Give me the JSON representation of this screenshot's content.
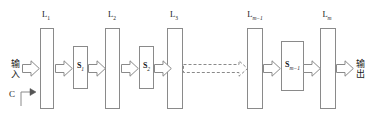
{
  "diagram": {
    "type": "block-diagram",
    "background_color": "#ffffff",
    "stroke_color": "#8a8a8a",
    "text_color": "#1a1a1a",
    "input_label": {
      "line1": "输",
      "line2": "入"
    },
    "output_label": {
      "line1": "输",
      "line2": "出"
    },
    "control_label": "C",
    "layers": [
      {
        "name": "L1",
        "base": "L",
        "sub": "1",
        "sub_italic": false
      },
      {
        "name": "L2",
        "base": "L",
        "sub": "2",
        "sub_italic": false
      },
      {
        "name": "L3",
        "base": "L",
        "sub": "3",
        "sub_italic": false
      },
      {
        "name": "Lm-1",
        "base": "L",
        "sub": "m−1",
        "sub_italic": true
      },
      {
        "name": "Lm",
        "base": "L",
        "sub": "m",
        "sub_italic": true
      }
    ],
    "stages": [
      {
        "name": "S1",
        "base": "S",
        "sub": "1",
        "sub_italic": false
      },
      {
        "name": "S2",
        "base": "S",
        "sub": "2",
        "sub_italic": false
      },
      {
        "name": "Sm-1",
        "base": "S",
        "sub": "m−1",
        "sub_italic": true
      }
    ],
    "connector_style": {
      "solid": "hollow-block-arrow",
      "elided": "dashed-hollow-block-arrow"
    },
    "icons": {
      "arrow": "block-arrow-icon",
      "dashed_arrow": "dashed-block-arrow-icon",
      "control_arrow": "elbow-arrow-icon"
    }
  }
}
